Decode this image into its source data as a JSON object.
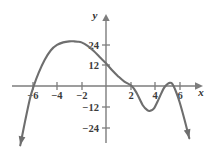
{
  "figure": {
    "name": "polynomial-graph",
    "background_color": "#ffffff",
    "curve_color": "#6e6e6e",
    "axis_color": "#7d7d7d",
    "label_color": "#3b3b3b"
  },
  "axes": {
    "x_axis_label": "x",
    "y_axis_label": "y",
    "x_ticks": [
      {
        "value": -6,
        "label": "−6",
        "px": 33
      },
      {
        "value": -4,
        "label": "−4",
        "px": 57
      },
      {
        "value": -2,
        "label": "−2",
        "px": 82
      },
      {
        "value": 2,
        "label": "2",
        "px": 131
      },
      {
        "value": 4,
        "label": "4",
        "px": 155
      },
      {
        "value": 6,
        "label": "6",
        "px": 180
      }
    ],
    "y_ticks": [
      {
        "value": 24,
        "label": "24",
        "px": 45
      },
      {
        "value": 12,
        "label": "12",
        "px": 65
      },
      {
        "value": -12,
        "label": "−12",
        "px": 107
      },
      {
        "value": -24,
        "label": "−24",
        "px": 128
      }
    ],
    "origin_px": {
      "x": 106,
      "y": 86
    },
    "x_scale_px_per_unit": 12.25,
    "y_scale_px_per_unit": 1.745
  },
  "chart_data": {
    "type": "line",
    "title": "",
    "xlabel": "x",
    "ylabel": "y",
    "xlim": [
      -7.8,
      7.5
    ],
    "ylim": [
      -38,
      38
    ],
    "grid": false,
    "legend": null,
    "x_ticks": [
      -6,
      -4,
      -2,
      2,
      4,
      6
    ],
    "y_ticks": [
      24,
      12,
      -12,
      -24
    ],
    "series": [
      {
        "name": "f(x)",
        "x": [
          -7.0,
          -6.6,
          -6.2,
          -5.9,
          -5.5,
          -5.0,
          -4.5,
          -4.0,
          -3.5,
          -3.0,
          -2.6,
          -2.3,
          -2.0,
          -1.5,
          -1.0,
          -0.5,
          0.0,
          0.5,
          1.0,
          1.5,
          2.1,
          2.5,
          3.0,
          3.4,
          3.6,
          3.9,
          4.3,
          4.7,
          5.0,
          5.2,
          5.4,
          5.7,
          6.0,
          6.4,
          6.8
        ],
        "y": [
          -34.0,
          -20.0,
          -7.0,
          0.0,
          7.5,
          15.0,
          20.5,
          23.5,
          25.0,
          25.6,
          25.6,
          25.4,
          25.0,
          23.0,
          20.0,
          16.5,
          13.0,
          9.0,
          5.5,
          2.5,
          0.0,
          -4.0,
          -11.0,
          -14.0,
          -14.2,
          -13.0,
          -7.5,
          -1.5,
          1.0,
          1.8,
          1.3,
          -3.0,
          -9.0,
          -19.0,
          -30.0
        ]
      }
    ],
    "features": {
      "left_x_intercept": -5.9,
      "global_max": {
        "x": -2.3,
        "y": 25.6
      },
      "y_intercept": 13,
      "right_x_intercept": 2.1,
      "local_min": {
        "x": 3.6,
        "y": -14.2
      },
      "local_max": {
        "x": 5.2,
        "y": 1.8
      },
      "final_x_intercept": 5.5,
      "end_behavior_left": "down-arrow",
      "end_behavior_right": "down-arrow"
    }
  }
}
